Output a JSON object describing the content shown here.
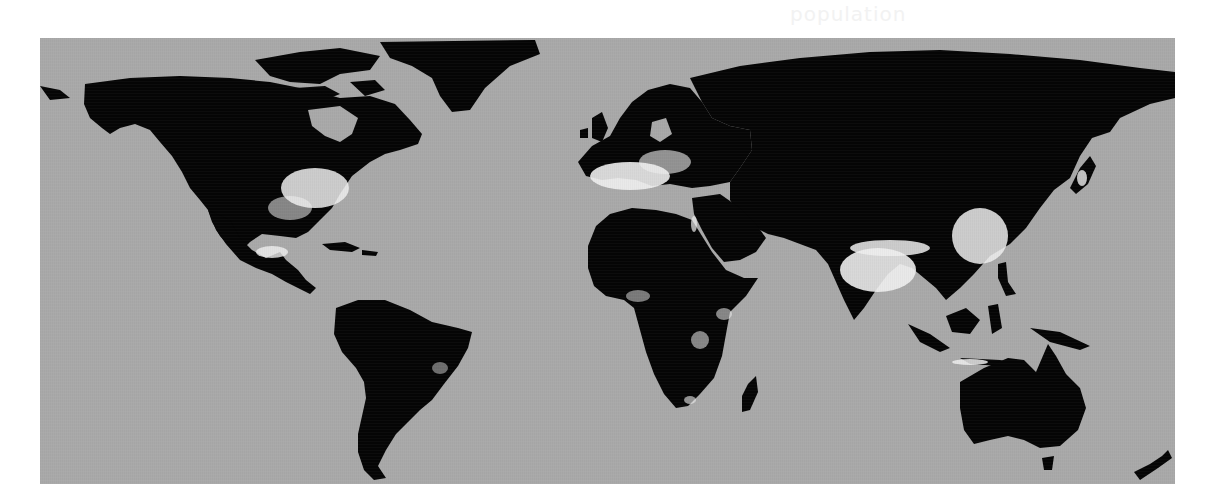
{
  "figure": {
    "ghost_text": "population",
    "colors": {
      "ocean": "#a9a9a9",
      "land": "#050505",
      "high_density": "#f0f0f0",
      "page_background": "#ffffff"
    },
    "regions": [
      {
        "name": "North America",
        "hotspot": "Eastern United States"
      },
      {
        "name": "Central America",
        "hotspot": "Mexico City region"
      },
      {
        "name": "South America",
        "hotspot": "Southeast Brazil coast"
      },
      {
        "name": "Europe",
        "hotspot": "Western & Central Europe"
      },
      {
        "name": "Africa",
        "hotspot": "Nigeria, Ethiopia, Great Lakes"
      },
      {
        "name": "Asia",
        "hotspot": "India, Eastern China, Japan, Java"
      },
      {
        "name": "Oceania",
        "hotspot": "Southeast Australia"
      }
    ]
  }
}
